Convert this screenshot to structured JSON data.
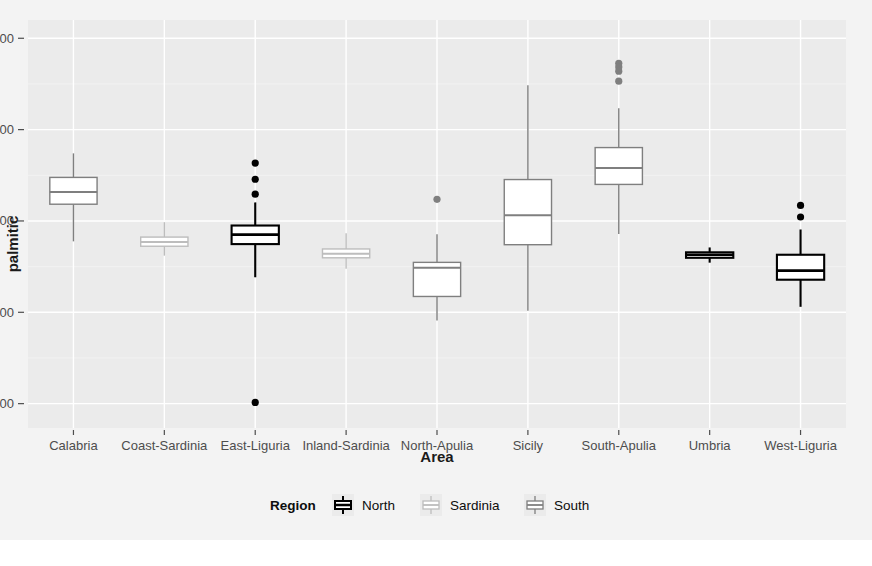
{
  "figure": {
    "background_color": "#ffffff",
    "panel_background_color": "#ebebeb",
    "grid_color": "#ffffff",
    "outer_band_color": "#f2f2f2"
  },
  "chart_data": {
    "type": "boxplot",
    "title": "",
    "subtitle": "",
    "xlabel": "Area",
    "ylabel": "palmitic",
    "grid": true,
    "legend_position": "bottom",
    "legend_title": "Region",
    "ylim": [
      520,
      1860
    ],
    "yticks": [
      600,
      900,
      1200,
      1500,
      1800
    ],
    "ytick_labels": [
      "600",
      "900",
      "1200",
      "1500",
      "1800"
    ],
    "categories": [
      "Calabria",
      "Coast-Sardinia",
      "East-Liguria",
      "Inland-Sardinia",
      "North-Apulia",
      "Sicily",
      "South-Apulia",
      "Umbria",
      "West-Liguria"
    ],
    "groups": [
      {
        "name": "North",
        "stroke": "#000000",
        "fill": "#ffffff"
      },
      {
        "name": "Sardinia",
        "stroke": "#bdbdbd",
        "fill": "#ffffff"
      },
      {
        "name": "South",
        "stroke": "#7f7f7f",
        "fill": "#ffffff"
      }
    ],
    "boxes": [
      {
        "category": "Calabria",
        "region": "South",
        "lower_whisker": 1133,
        "q1": 1255,
        "median": 1295,
        "q3": 1343,
        "upper_whisker": 1422,
        "outliers": []
      },
      {
        "category": "Coast-Sardinia",
        "region": "Sardinia",
        "lower_whisker": 1086,
        "q1": 1117,
        "median": 1131,
        "q3": 1147,
        "upper_whisker": 1196,
        "outliers": []
      },
      {
        "category": "East-Liguria",
        "region": "North",
        "lower_whisker": 1015,
        "q1": 1124,
        "median": 1155,
        "q3": 1185,
        "upper_whisker": 1261,
        "outliers": [
          1390,
          1337,
          1288,
          604
        ]
      },
      {
        "category": "Inland-Sardinia",
        "region": "Sardinia",
        "lower_whisker": 1043,
        "q1": 1079,
        "median": 1092,
        "q3": 1108,
        "upper_whisker": 1160,
        "outliers": []
      },
      {
        "category": "North-Apulia",
        "region": "South",
        "lower_whisker": 873,
        "q1": 952,
        "median": 1046,
        "q3": 1064,
        "upper_whisker": 1156,
        "outliers": [
          1271
        ]
      },
      {
        "category": "Sicily",
        "region": "South",
        "lower_whisker": 905,
        "q1": 1122,
        "median": 1219,
        "q3": 1336,
        "upper_whisker": 1646,
        "outliers": []
      },
      {
        "category": "South-Apulia",
        "region": "South",
        "lower_whisker": 1157,
        "q1": 1320,
        "median": 1374,
        "q3": 1441,
        "upper_whisker": 1570,
        "outliers": [
          1718,
          1706,
          1692,
          1659
        ]
      },
      {
        "category": "Umbria",
        "region": "North",
        "lower_whisker": 1063,
        "q1": 1079,
        "median": 1089,
        "q3": 1097,
        "upper_whisker": 1113,
        "outliers": []
      },
      {
        "category": "West-Liguria",
        "region": "North",
        "lower_whisker": 918,
        "q1": 1007,
        "median": 1037,
        "q3": 1089,
        "upper_whisker": 1172,
        "outliers": [
          1251,
          1213
        ]
      }
    ]
  },
  "legend": {
    "title": "Region",
    "entries": [
      {
        "label": "North",
        "key_name": "boxplot-key-north"
      },
      {
        "label": "Sardinia",
        "key_name": "boxplot-key-sardinia"
      },
      {
        "label": "South",
        "key_name": "boxplot-key-south"
      }
    ]
  }
}
